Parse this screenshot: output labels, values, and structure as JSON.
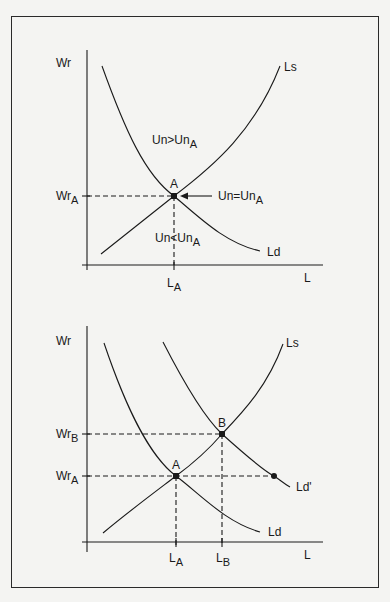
{
  "figure": {
    "panels": [
      {
        "id": "top",
        "y_axis_label": "Wr",
        "x_axis_label": "L",
        "curves": {
          "supply": "Ls",
          "demand": "Ld"
        },
        "points": [
          {
            "name": "A",
            "wage_label_main": "Wr",
            "wage_label_sub": "A",
            "labor_label_main": "L",
            "labor_label_sub": "A"
          }
        ],
        "region_labels": {
          "above": {
            "main": "Un>Un",
            "sub": "A"
          },
          "below": {
            "main": "Un<Un",
            "sub": "A"
          },
          "equilibrium": {
            "main": "Un=Un",
            "sub": "A"
          }
        }
      },
      {
        "id": "bottom",
        "y_axis_label": "Wr",
        "x_axis_label": "L",
        "curves": {
          "supply": "Ls",
          "demand": "Ld",
          "demand_shifted": "Ld'"
        },
        "points": [
          {
            "name": "A",
            "wage_label_main": "Wr",
            "wage_label_sub": "A",
            "labor_label_main": "L",
            "labor_label_sub": "A"
          },
          {
            "name": "B",
            "wage_label_main": "Wr",
            "wage_label_sub": "B",
            "labor_label_main": "L",
            "labor_label_sub": "B"
          }
        ]
      }
    ],
    "colors": {
      "ink": "#1a1a1a",
      "paper": "#f4f4f2"
    }
  }
}
